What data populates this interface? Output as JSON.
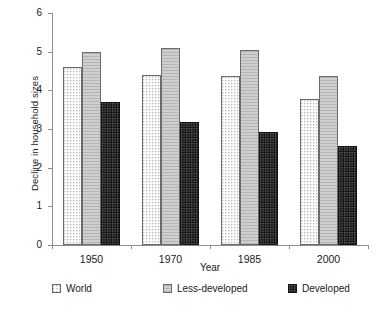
{
  "chart_data": {
    "type": "bar",
    "title": "",
    "xlabel": "Year",
    "ylabel": "Decline in household sizes",
    "categories": [
      "1950",
      "1970",
      "1985",
      "2000"
    ],
    "series": [
      {
        "name": "World",
        "values": [
          4.6,
          4.4,
          4.38,
          3.78
        ],
        "pattern": "light-dotted",
        "color": "#fdfdfd"
      },
      {
        "name": "Less-developed",
        "values": [
          5.0,
          5.1,
          5.05,
          4.37
        ],
        "pattern": "gray-horizontal-lines",
        "color": "#c0c0c0"
      },
      {
        "name": "Developed",
        "values": [
          3.7,
          3.18,
          2.93,
          2.57
        ],
        "pattern": "black-dotted",
        "color": "#141414"
      }
    ],
    "ylim": [
      0,
      6
    ],
    "yticks": [
      0,
      1,
      2,
      3,
      4,
      5,
      6
    ],
    "ytick_labels": [
      "0",
      "1",
      "2",
      "3",
      "4",
      "5",
      "6"
    ],
    "grid": false,
    "legend_position": "bottom"
  },
  "axes": {
    "y_title": "Decline in household sizes",
    "x_title": "Year"
  },
  "legend": {
    "items": [
      {
        "label": "World"
      },
      {
        "label": "Less-developed"
      },
      {
        "label": "Developed"
      }
    ]
  }
}
